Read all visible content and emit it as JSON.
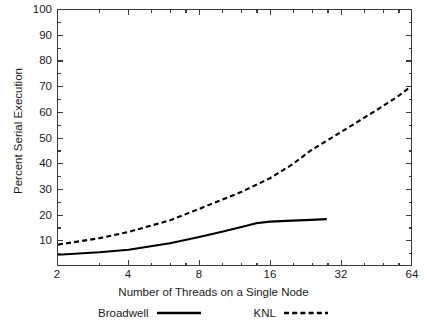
{
  "chart_data": {
    "type": "line",
    "title": "",
    "xlabel": "Number of Threads on a Single Node",
    "ylabel": "Percent Serial Execution",
    "xscale": "log2",
    "xlim": [
      2,
      64
    ],
    "ylim": [
      0,
      100
    ],
    "xticks": [
      2,
      4,
      8,
      16,
      32,
      64
    ],
    "xtick_labels": [
      "2",
      "4",
      "8",
      "16",
      "32",
      "64"
    ],
    "yticks": [
      10,
      20,
      30,
      40,
      50,
      60,
      70,
      80,
      90,
      100
    ],
    "ytick_labels": [
      "10",
      "20",
      "30",
      "40",
      "50",
      "60",
      "70",
      "80",
      "90",
      "100"
    ],
    "grid": false,
    "legend_position": "below-axes",
    "series": [
      {
        "name": "Broadwell",
        "style": "solid",
        "color": "#000000",
        "x": [
          2,
          3,
          4,
          6,
          8,
          10,
          12,
          14,
          16,
          20,
          24,
          28
        ],
        "values": [
          4.0,
          5.0,
          6.0,
          8.5,
          11.0,
          13.0,
          14.8,
          16.4,
          17.0,
          17.4,
          17.7,
          18.0
        ]
      },
      {
        "name": "KNL",
        "style": "dashed",
        "color": "#000000",
        "x": [
          2,
          3,
          4,
          6,
          8,
          12,
          16,
          20,
          24,
          32,
          40,
          48,
          56,
          64
        ],
        "values": [
          8.0,
          10.5,
          13.0,
          17.5,
          22.0,
          28.5,
          34.0,
          39.5,
          45.0,
          52.0,
          57.5,
          62.0,
          66.0,
          70.0
        ]
      }
    ]
  },
  "axes": {
    "y_title": "Percent Serial Execution",
    "x_title": "Number of Threads on a Single Node"
  },
  "legend": {
    "items": [
      {
        "label": "Broadwell",
        "swatch": "solid-line-swatch"
      },
      {
        "label": "KNL",
        "swatch": "dashed-line-swatch"
      }
    ]
  }
}
